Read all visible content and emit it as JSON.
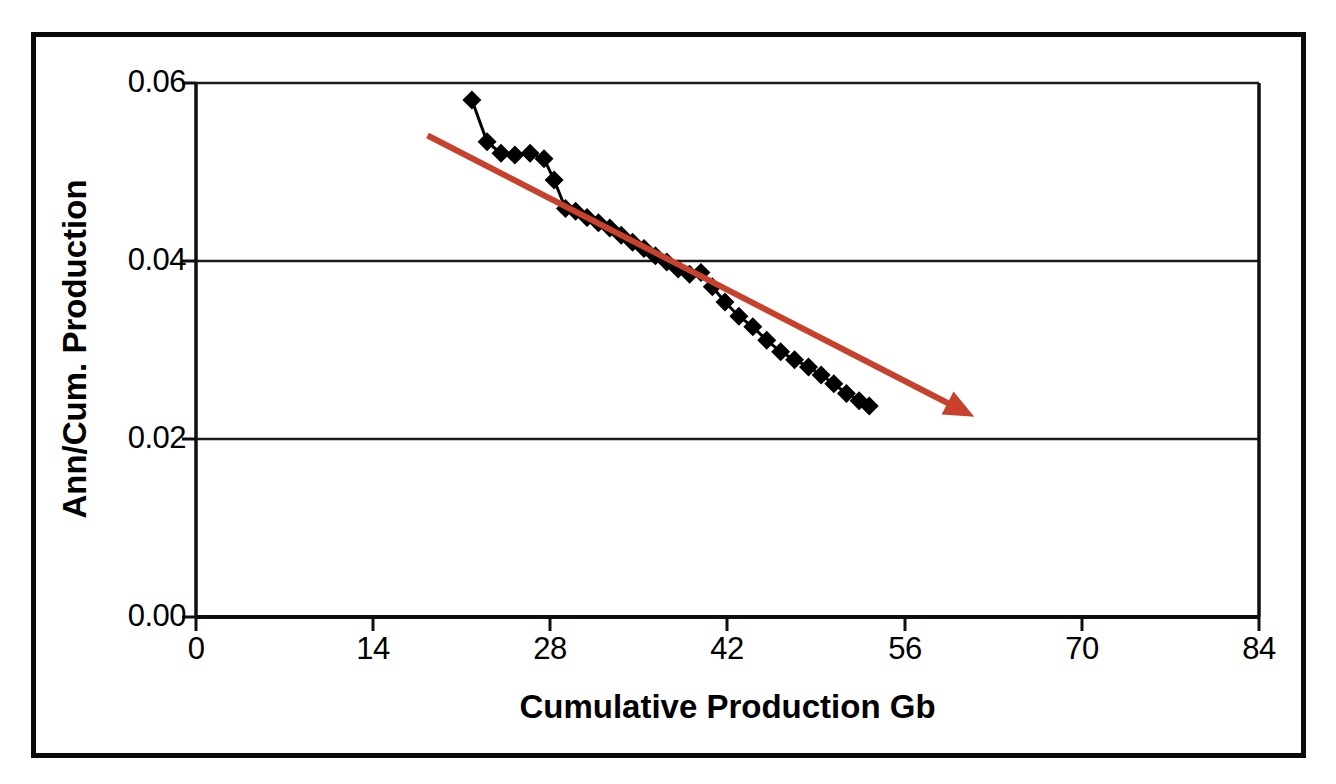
{
  "chart_data": {
    "type": "line",
    "title": "",
    "xlabel": "Cumulative Production Gb",
    "ylabel": "Ann/Cum. Production",
    "xlim": [
      0,
      84
    ],
    "ylim": [
      0.0,
      0.06
    ],
    "xticks": [
      "0",
      "14",
      "28",
      "42",
      "56",
      "70",
      "84"
    ],
    "yticks": [
      "0.06",
      "0.04",
      "0.02",
      "0.00"
    ],
    "grid": "horizontal",
    "legend": "none",
    "series": [
      {
        "name": "Ann/Cum. Production",
        "marker": "diamond",
        "marker_color": "#000000",
        "line_color": "#000000",
        "x": [
          21.8,
          23.0,
          24.1,
          25.2,
          26.4,
          27.5,
          28.3,
          29.2,
          30.0,
          30.9,
          31.8,
          32.7,
          33.6,
          34.5,
          35.4,
          36.3,
          37.2,
          38.1,
          39.0,
          39.9,
          40.8,
          41.8,
          42.9,
          44.0,
          45.1,
          46.2,
          47.3,
          48.4,
          49.4,
          50.4,
          51.4,
          52.4,
          53.2
        ],
        "y": [
          0.0581,
          0.0534,
          0.0521,
          0.0519,
          0.0521,
          0.0515,
          0.0491,
          0.0459,
          0.0456,
          0.0449,
          0.0443,
          0.0437,
          0.0429,
          0.0421,
          0.0414,
          0.0406,
          0.0399,
          0.0391,
          0.0385,
          0.0387,
          0.0371,
          0.0354,
          0.0338,
          0.0326,
          0.0311,
          0.0298,
          0.0289,
          0.0281,
          0.0272,
          0.0262,
          0.0251,
          0.0243,
          0.0237
        ]
      }
    ],
    "annotations": [
      {
        "name": "trend-arrow",
        "type": "arrow",
        "color": "#C8412C",
        "x_start": 18.3,
        "y_start": 0.0541,
        "x_end": 61.5,
        "y_end": 0.0225
      }
    ]
  },
  "axes": {
    "y_title": "Ann/Cum. Production",
    "x_title": "Cumulative Production Gb",
    "y_tick_labels": [
      "0.06",
      "0.04",
      "0.02",
      "0.00"
    ],
    "x_tick_labels": [
      "0",
      "14",
      "28",
      "42",
      "56",
      "70",
      "84"
    ]
  },
  "colors": {
    "trend": "#C8412C",
    "series": "#000000",
    "frame": "#0a0a0a",
    "gridline": "#1a1a1a",
    "background": "#ffffff"
  }
}
